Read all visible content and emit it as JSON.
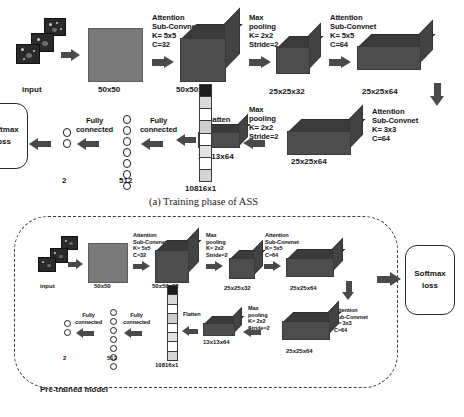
{
  "figure": {
    "caption_a": "(a) Training phase of ASS",
    "pretrained_label": "Pre-trained model"
  },
  "labels": {
    "input": "input",
    "flatten": "Flatten",
    "fully_connected": "Fully\nconnected",
    "softmax": "Softmax\nloss",
    "attention_k5_c32": "Attention\nSub-Convnet\nK= 5x5\nC=32",
    "attention_k5_c64": "Attention\nSub-Convnet\nK= 5x5\nC=64",
    "attention_k3_c64": "Attention\nSub-Convnet\nK= 3x3\nC=64",
    "maxpool": "Max\npooling\nK= 2x2\nStride=2"
  },
  "dims": {
    "d50x50": "50x50",
    "d50x50x32": "50x50x32",
    "d25x25x32": "25x25x32",
    "d25x25x64": "25x25x64",
    "d13x13x64": "13x13x64",
    "flatten_len": "10816x1",
    "fc512": "512",
    "fc2": "2"
  },
  "colors": {
    "box_front": "#4d4d4d",
    "box_top": "#3a3a3a",
    "box_side": "#434343",
    "input_square": "#7a7a7a",
    "arrow": "#4a4a4a",
    "dash_border": "#3a3a3a",
    "text": "#141414"
  }
}
